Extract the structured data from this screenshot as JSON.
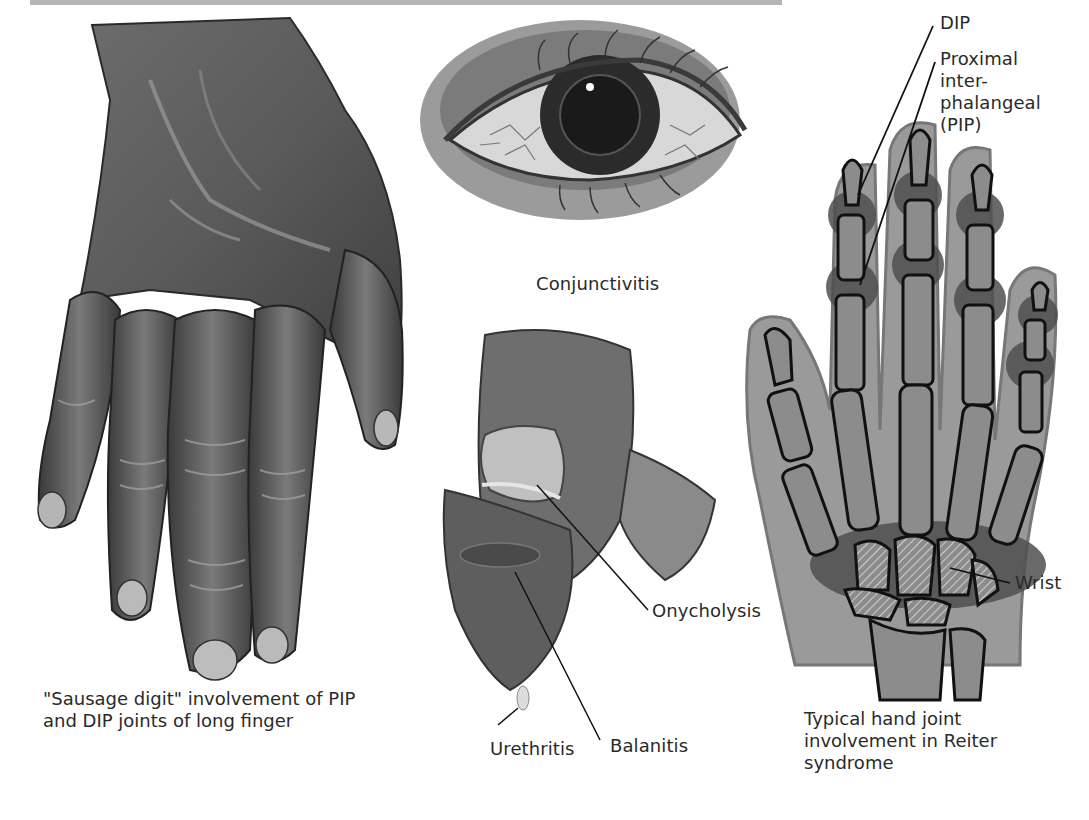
{
  "figure": {
    "header_bar_color": "#b5b5b5",
    "panels": [
      {
        "id": "sausage-digit",
        "caption_lines": [
          "\"Sausage digit\" involvement of PIP",
          "and DIP joints of long finger"
        ]
      },
      {
        "id": "eye",
        "caption": "Conjunctivitis"
      },
      {
        "id": "genital-nail",
        "labels": {
          "onycholysis": "Onycholysis",
          "balanitis": "Balanitis",
          "urethritis": "Urethritis"
        }
      },
      {
        "id": "xray-hand",
        "labels": {
          "dip": "DIP",
          "pip_lines": [
            "Proximal",
            "inter-",
            "phalangeal",
            "(PIP)"
          ],
          "wrist": "Wrist"
        },
        "caption_lines": [
          "Typical hand joint",
          "involvement in Reiter",
          "syndrome"
        ]
      }
    ],
    "colors": {
      "skin_dark": "#4a4a4a",
      "skin_mid": "#7a7a7a",
      "skin_light": "#b0b0b0",
      "xray_tissue": "#9a9a9a",
      "xray_bone": "#8c8c8c",
      "joint_inflamed": "#4f4f4f",
      "outline": "#111111"
    }
  }
}
